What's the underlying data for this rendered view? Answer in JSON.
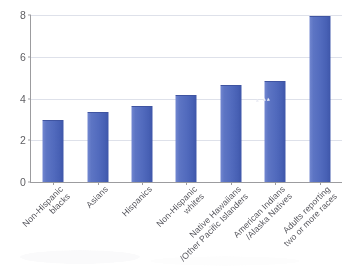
{
  "chart_data": {
    "type": "bar",
    "title": "",
    "xlabel": "",
    "ylabel": "",
    "ylim": [
      0,
      8
    ],
    "yticks": [
      "0",
      "2",
      "4",
      "6",
      "8"
    ],
    "grid": true,
    "legend": "none",
    "orientation": "vertical",
    "series_color": "#5470C6",
    "categories": [
      "Non-Hispanic blacks",
      "Asians",
      "Hispanics",
      "Non-Hispanic whites",
      "Native Hawaiians /Other Pacific Islanders",
      "American Indians /Alaska Natives",
      "Adults reporting two or more races"
    ],
    "category_lines": [
      [
        "Non-Hispanic",
        "blacks"
      ],
      [
        "Asians",
        ""
      ],
      [
        "Hispanics",
        ""
      ],
      [
        "Non-Hispanic",
        "whites"
      ],
      [
        "Native Hawaiians",
        "/Other Pacific Islanders"
      ],
      [
        "American Indians",
        "/Alaska Natives"
      ],
      [
        "Adults reporting",
        "two or more races"
      ]
    ],
    "values": [
      2.9,
      3.3,
      3.6,
      4.1,
      4.6,
      4.8,
      7.9
    ]
  },
  "colors": {
    "bar_fill": "#5470C6",
    "bar_edge": "#3C53A6",
    "gridline": "#DCDFE8",
    "axis": "#9A9A9E",
    "tick_text": "#5C5C60",
    "label_text": "#53535A",
    "background": "#FFFFFF"
  }
}
